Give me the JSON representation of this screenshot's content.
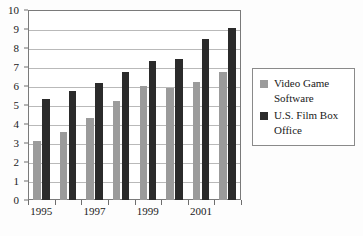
{
  "chart_data": {
    "type": "bar",
    "title": "",
    "subtitle": "",
    "xlabel": "",
    "ylabel": "",
    "categories": [
      "1995",
      "1996",
      "1997",
      "1998",
      "1999",
      "2000",
      "2001",
      "2002"
    ],
    "x_tick_labels": [
      "1995",
      "",
      "1997",
      "",
      "1999",
      "",
      "2001",
      ""
    ],
    "y_tick_labels": [
      "0",
      "1",
      "2",
      "3",
      "4",
      "5",
      "6",
      "7",
      "8",
      "9",
      "10"
    ],
    "ylim": [
      0,
      10
    ],
    "grid": true,
    "legend_position": "right",
    "series": [
      {
        "name": "Video Game Software",
        "color": "#9b9b9b",
        "values": [
          3.1,
          3.6,
          4.3,
          5.2,
          6.0,
          5.9,
          6.2,
          6.75
        ]
      },
      {
        "name": "U.S. Film Box Office",
        "color": "#2b2b2b",
        "values": [
          5.3,
          5.75,
          6.15,
          6.75,
          7.3,
          7.4,
          8.45,
          9.05
        ]
      }
    ]
  },
  "legend": {
    "entries": [
      {
        "label": "Video Game Software",
        "swatch_name": "legend-swatch-video-game-software"
      },
      {
        "label": "U.S. Film Box Office",
        "swatch_name": "legend-swatch-us-film-box-office"
      }
    ]
  }
}
